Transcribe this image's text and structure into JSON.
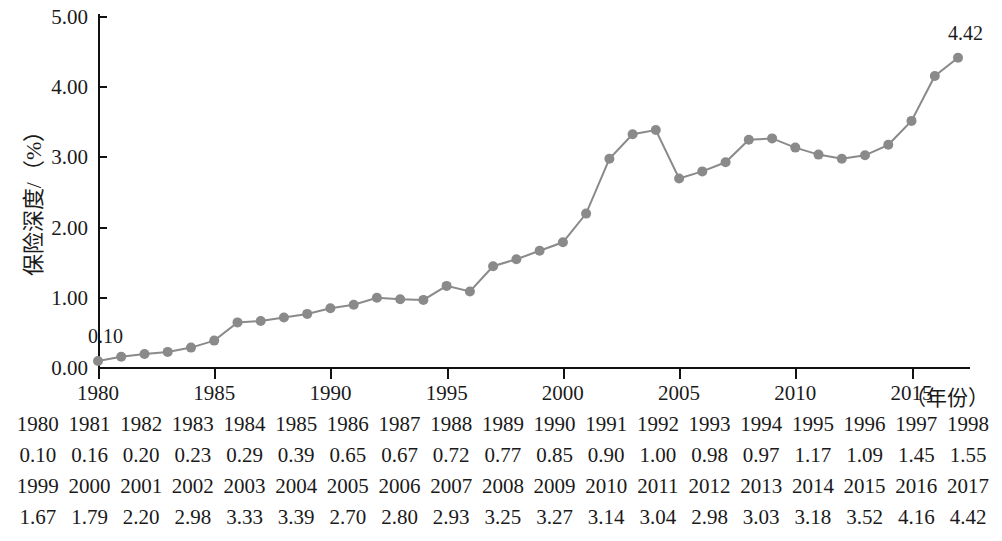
{
  "chart_data": {
    "type": "line",
    "title": "",
    "xlabel": "（年份）",
    "ylabel": "保险深度/（%）",
    "xlim": [
      1980,
      2017
    ],
    "ylim": [
      0.0,
      5.0
    ],
    "grid": false,
    "legend": "none",
    "marker": "circle",
    "series_color": "#8a8a8a",
    "x": [
      1980,
      1981,
      1982,
      1983,
      1984,
      1985,
      1986,
      1987,
      1988,
      1989,
      1990,
      1991,
      1992,
      1993,
      1994,
      1995,
      1996,
      1997,
      1998,
      1999,
      2000,
      2001,
      2002,
      2003,
      2004,
      2005,
      2006,
      2007,
      2008,
      2009,
      2010,
      2011,
      2012,
      2013,
      2014,
      2015,
      2016,
      2017
    ],
    "values": [
      0.1,
      0.16,
      0.2,
      0.23,
      0.29,
      0.39,
      0.65,
      0.67,
      0.72,
      0.77,
      0.85,
      0.9,
      1.0,
      0.98,
      0.97,
      1.17,
      1.09,
      1.45,
      1.55,
      1.67,
      1.79,
      2.2,
      2.98,
      3.33,
      3.39,
      2.7,
      2.8,
      2.93,
      3.25,
      3.27,
      3.14,
      3.04,
      2.98,
      3.03,
      3.18,
      3.52,
      4.16,
      4.42
    ],
    "y_tick_labels": [
      "0.00",
      "1.00",
      "2.00",
      "3.00",
      "4.00",
      "5.00"
    ],
    "y_tick_values": [
      0.0,
      1.0,
      2.0,
      3.0,
      4.0,
      5.0
    ],
    "x_tick_labels": [
      "1980",
      "1985",
      "1990",
      "1995",
      "2000",
      "2005",
      "2010",
      "2015"
    ],
    "x_tick_values": [
      1980,
      1985,
      1990,
      1995,
      2000,
      2005,
      2010,
      2015
    ],
    "annotations": [
      {
        "text": "0.10",
        "x": 1980,
        "y": 0.1
      },
      {
        "text": "4.42",
        "x": 2017,
        "y": 4.42
      }
    ]
  },
  "table": {
    "rows": [
      [
        "1980",
        "1981",
        "1982",
        "1983",
        "1984",
        "1985",
        "1986",
        "1987",
        "1988",
        "1989",
        "1990",
        "1991",
        "1992",
        "1993",
        "1994",
        "1995",
        "1996",
        "1997",
        "1998"
      ],
      [
        "0.10",
        "0.16",
        "0.20",
        "0.23",
        "0.29",
        "0.39",
        "0.65",
        "0.67",
        "0.72",
        "0.77",
        "0.85",
        "0.90",
        "1.00",
        "0.98",
        "0.97",
        "1.17",
        "1.09",
        "1.45",
        "1.55"
      ],
      [
        "1999",
        "2000",
        "2001",
        "2002",
        "2003",
        "2004",
        "2005",
        "2006",
        "2007",
        "2008",
        "2009",
        "2010",
        "2011",
        "2012",
        "2013",
        "2014",
        "2015",
        "2016",
        "2017"
      ],
      [
        "1.67",
        "1.79",
        "2.20",
        "2.98",
        "3.33",
        "3.39",
        "2.70",
        "2.80",
        "2.93",
        "3.25",
        "3.27",
        "3.14",
        "3.04",
        "2.98",
        "3.03",
        "3.18",
        "3.52",
        "4.16",
        "4.42"
      ]
    ]
  }
}
